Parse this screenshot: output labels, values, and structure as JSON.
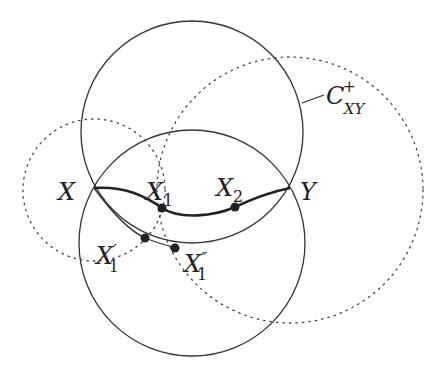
{
  "diagram": {
    "labels": {
      "X": "X",
      "Y": "Y",
      "X1_base": "X",
      "X1_sub": "1",
      "X2_base": "X",
      "X2_sub": "2",
      "X1p_base": "X",
      "X1p_sub": "1",
      "X1p_mark": "′",
      "X1pp_base": "X",
      "X1pp_sub": "1",
      "X1pp_mark": "″",
      "C_base": "C",
      "C_sup": "+",
      "C_sub": "XY"
    },
    "colors": {
      "stroke": "#333333",
      "background": "#ffffff"
    }
  }
}
